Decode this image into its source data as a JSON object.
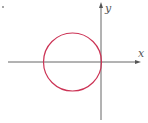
{
  "diagram": {
    "type": "coordinate-plane-with-circle",
    "x_axis_label": "x",
    "y_axis_label": "y",
    "circle": {
      "description": "circle tangent to the y-axis at the origin, centered on the negative x-axis",
      "color": "#cc3355"
    },
    "axis_color": "#666666"
  }
}
